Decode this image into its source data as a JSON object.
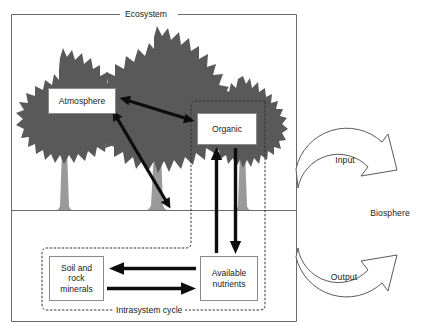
{
  "figure": {
    "ecosystem_label": "Ecosystem",
    "intrasystem_label": "Intrasystem cycle",
    "biosphere_label": "Biosphere",
    "input_label": "Input",
    "output_label": "Output"
  },
  "boxes": {
    "atmosphere": {
      "label": "Atmosphere"
    },
    "organic": {
      "label": "Organic"
    },
    "soil": {
      "label": "Soil and\nrock\nminerals"
    },
    "nutrients": {
      "label": "Available\nnutrients"
    }
  },
  "colors": {
    "tree_canopy": "#595959",
    "tree_trunk": "#9a9a9a",
    "frame_line": "#6b6b6b",
    "box_border": "#8a8a8a",
    "arrow_solid": "#0d0d0d",
    "arrow_outline_stroke": "#5a5a5a",
    "text": "#1a1a1a",
    "background": "#ffffff"
  },
  "flows": {
    "atmosphere_organic": "bidirectional",
    "atmosphere_soil": "bidirectional",
    "nutrients_to_organic": "upward",
    "organic_to_nutrients": "downward",
    "nutrients_to_soil": "leftward",
    "soil_to_nutrients": "rightward",
    "biosphere_input": "into ecosystem",
    "biosphere_output": "out of ecosystem"
  }
}
